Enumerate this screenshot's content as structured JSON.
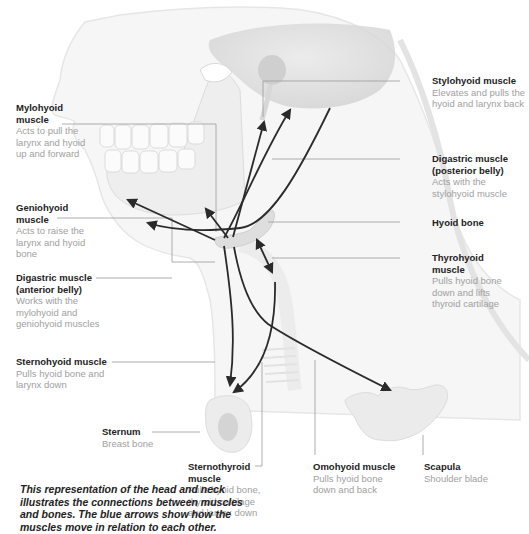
{
  "figure": {
    "caption": "This representation of the head and neck illustrates the connections between muscles and bones. The blue arrows show how the muscles move in relation to each other.",
    "colors": {
      "arrow": "#2a2a2a",
      "leader_line": "#9a9a9a",
      "bone_fill": "#e6e6e6",
      "skin_fill": "#f3f3f3",
      "title_text": "#222222",
      "desc_text": "#a0a0a0"
    }
  },
  "labels": {
    "mylohyoid": {
      "title": "Mylohyoid muscle",
      "desc": "Acts to pull the larynx and hyoid up and forward"
    },
    "geniohyoid": {
      "title": "Geniohyoid muscle",
      "desc": "Acts to raise the larynx and hyoid bone"
    },
    "digastric_anterior": {
      "title": "Digastric muscle (anterior belly)",
      "desc": "Works with the mylohyoid and geniohyoid muscles"
    },
    "sternohyoid": {
      "title": "Sternohyoid muscle",
      "desc": "Pulls hyoid bone and larynx down"
    },
    "sternum": {
      "title": "Sternum",
      "desc": "Breast bone"
    },
    "stylohyoid": {
      "title": "Stylohyoid muscle",
      "desc": "Elevates and pulls the hyoid and larynx back"
    },
    "digastric_posterior": {
      "title": "Digastric muscle (posterior belly)",
      "desc": "Acts with the stylohyoid muscle"
    },
    "hyoid": {
      "title": "Hyoid bone",
      "desc": ""
    },
    "thyrohyoid": {
      "title": "Thyrohyoid muscle",
      "desc": "Pulls hyoid bone down and lifts thyroid cartilage"
    },
    "sternothyroid": {
      "title": "Sternothyroid muscle",
      "desc": "Pulls hyoid bone, thyroid cartilage and larynx down"
    },
    "omohyoid": {
      "title": "Omohyoid muscle",
      "desc": "Pulls hyoid bone down and back"
    },
    "scapula": {
      "title": "Scapula",
      "desc": "Shoulder blade"
    }
  }
}
